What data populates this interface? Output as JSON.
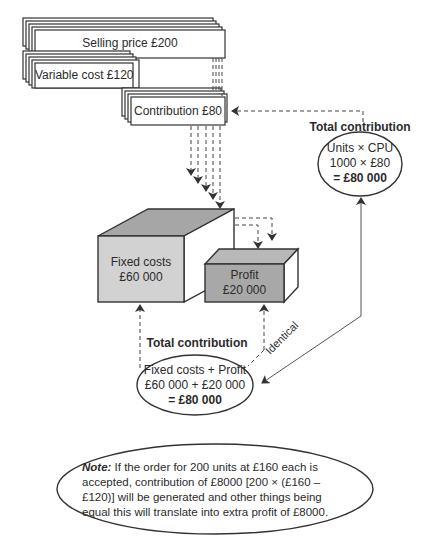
{
  "boxes": {
    "selling_price": "Selling price £200",
    "variable_cost": "Variable cost £120",
    "contribution": "Contribution £80"
  },
  "blocks": {
    "fixed_costs": {
      "label": "Fixed costs",
      "value": "£60 000",
      "color": "#d0d0d0"
    },
    "profit": {
      "label": "Profit",
      "value": "£20 000",
      "color": "#a9a9a9"
    }
  },
  "top_right": {
    "heading": "Total contribution",
    "line1": "Units × CPU",
    "line2": "1000 × £80",
    "line3": "= £80 000"
  },
  "bottom_center": {
    "heading": "Total contribution",
    "line1": "Fixed costs + Profit",
    "line2": "£60 000 + £20 000",
    "line3": "= £80 000"
  },
  "connector_label": "Identical",
  "note": {
    "prefix": "Note:",
    "text": "If the order for 200 units at £160 each is accepted, contribution of £8000 [200 × (£160 – £120)] will be generated and other things being equal this will translate into extra profit of £8000."
  }
}
